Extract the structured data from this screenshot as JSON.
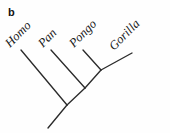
{
  "figure": {
    "panel_letter": "b",
    "type": "cladogram",
    "background_color": "#fefefe",
    "line_color": "#2b2b2b",
    "text_color": "#161616",
    "width": 170,
    "height": 133
  },
  "taxa": [
    {
      "name": "Homo",
      "label_x": 12,
      "label_y": 50,
      "rotation_deg": -45,
      "tip_x": 21,
      "tip_y": 50
    },
    {
      "name": "Pan",
      "label_x": 45,
      "label_y": 50,
      "rotation_deg": -45,
      "tip_x": 51,
      "tip_y": 50
    },
    {
      "name": "Pongo",
      "label_x": 76,
      "label_y": 50,
      "rotation_deg": -45,
      "tip_x": 83,
      "tip_y": 50
    },
    {
      "name": "Gorilla",
      "label_x": 116,
      "label_y": 53,
      "rotation_deg": -45,
      "tip_x": 132,
      "tip_y": 53
    }
  ],
  "nodes": {
    "root": {
      "x": 67,
      "y": 105
    },
    "node_pan": {
      "x": 85,
      "y": 88
    },
    "node_pongo": {
      "x": 101,
      "y": 70
    },
    "root_stem_end": {
      "x": 48,
      "y": 128
    }
  },
  "branches": [
    {
      "id": "branch-root-stem",
      "x1": 67,
      "y1": 105,
      "x2": 48,
      "y2": 128
    },
    {
      "id": "branch-homo",
      "x1": 67,
      "y1": 105,
      "x2": 21,
      "y2": 50
    },
    {
      "id": "branch-spine-root-to-pan",
      "x1": 67,
      "y1": 105,
      "x2": 85,
      "y2": 88
    },
    {
      "id": "branch-pan",
      "x1": 85,
      "y1": 88,
      "x2": 51,
      "y2": 50
    },
    {
      "id": "branch-spine-pan-to-pongo",
      "x1": 85,
      "y1": 88,
      "x2": 101,
      "y2": 70
    },
    {
      "id": "branch-pongo",
      "x1": 101,
      "y1": 70,
      "x2": 83,
      "y2": 50
    },
    {
      "id": "branch-gorilla",
      "x1": 101,
      "y1": 70,
      "x2": 132,
      "y2": 53
    }
  ]
}
